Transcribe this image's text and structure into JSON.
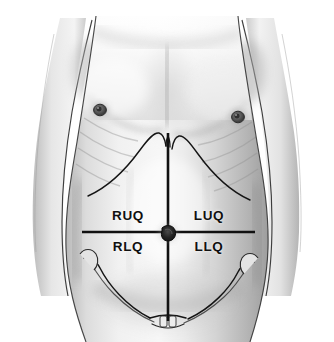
{
  "figure": {
    "width": 334,
    "height": 342,
    "background_color": "#ffffff",
    "line_color": "#111111",
    "skin_tone_light": "#f2f2f2",
    "skin_tone_mid": "#d8d8d8",
    "skin_tone_shadow": "#a8a8a8",
    "label_color": "#101010"
  },
  "quadrants": [
    {
      "id": "ruq",
      "label": "RUQ",
      "name": "right-upper-quadrant",
      "x": 128,
      "y": 215
    },
    {
      "id": "luq",
      "label": "LUQ",
      "name": "left-upper-quadrant",
      "x": 209,
      "y": 215
    },
    {
      "id": "rlq",
      "label": "RLQ",
      "name": "right-lower-quadrant",
      "x": 128,
      "y": 246
    },
    {
      "id": "llq",
      "label": "LLQ",
      "name": "left-lower-quadrant",
      "x": 209,
      "y": 246
    }
  ],
  "reference_lines": {
    "vertical": {
      "name": "median-sagittal-line",
      "x": 168,
      "y_top": 133,
      "y_bottom": 321
    },
    "horizontal": {
      "name": "transumbilical-line",
      "y": 232,
      "x_left": 82,
      "x_right": 255
    }
  },
  "landmarks": [
    {
      "name": "umbilicus",
      "x": 168,
      "y": 233
    },
    {
      "name": "right-nipple",
      "x": 100,
      "y": 110
    },
    {
      "name": "left-nipple",
      "x": 238,
      "y": 117
    },
    {
      "name": "xiphoid-process",
      "x": 168,
      "y": 134
    },
    {
      "name": "pubic-symphysis",
      "x": 168,
      "y": 320
    },
    {
      "name": "right-costal-margin",
      "x": 95,
      "y": 196
    },
    {
      "name": "left-costal-margin",
      "x": 243,
      "y": 200
    },
    {
      "name": "right-iliac-crest",
      "x": 88,
      "y": 262
    },
    {
      "name": "left-iliac-crest",
      "x": 250,
      "y": 266
    }
  ]
}
